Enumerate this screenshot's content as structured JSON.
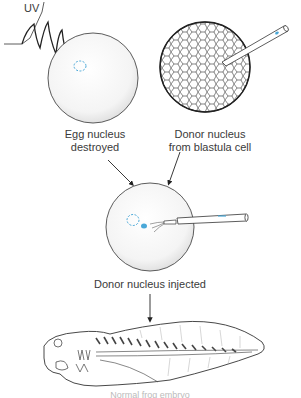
{
  "diagram": {
    "labels": {
      "uv": "UV",
      "egg_line1": "Egg nucleus",
      "egg_line2": "destroyed",
      "donor_line1": "Donor nucleus",
      "donor_line2": "from blastula cell",
      "injected": "Donor nucleus injected",
      "bottom_caption": "Normal frog embryo"
    },
    "colors": {
      "ink": "#2a2a2a",
      "nucleus": "#4aa8d8",
      "background": "#ffffff"
    },
    "steps": [
      {
        "id": "egg-uv",
        "label": "Egg nucleus destroyed"
      },
      {
        "id": "blastula-donor",
        "label": "Donor nucleus from blastula cell"
      },
      {
        "id": "injection",
        "label": "Donor nucleus injected"
      },
      {
        "id": "tadpole",
        "label": "Tadpole"
      }
    ]
  }
}
